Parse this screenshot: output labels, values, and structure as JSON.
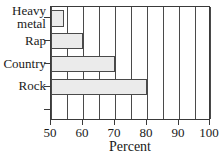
{
  "chart_data": {
    "type": "bar",
    "orientation": "horizontal",
    "title": "",
    "xlabel": "Percent",
    "ylabel": "",
    "categories": [
      "Heavy metal",
      "Rap",
      "Country",
      "Rock"
    ],
    "category_lines": [
      [
        "Heavy",
        "metal"
      ],
      [
        "Rap"
      ],
      [
        "Country"
      ],
      [
        "Rock"
      ]
    ],
    "values": [
      54,
      60,
      70,
      80
    ],
    "xlim": [
      50,
      100
    ],
    "xticks": [
      50,
      60,
      70,
      80,
      90,
      100
    ],
    "xtick_labels": [
      "50",
      "60",
      "70",
      "80",
      "90",
      "100"
    ],
    "gridline_values": [
      50,
      55,
      60,
      65,
      70,
      75,
      80,
      85,
      90,
      95,
      100
    ],
    "grid": true,
    "legend": "none",
    "bar_fill_color": "#ebebeb",
    "bar_border_color": "#4a4a4a",
    "axis_color": "#3a3a3a",
    "background_color": "#ffffff"
  }
}
